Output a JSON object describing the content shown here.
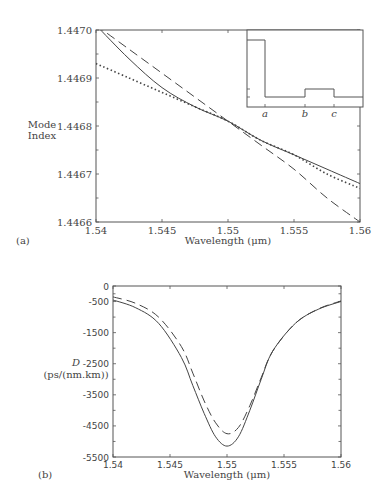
{
  "chart_data": [
    {
      "panel": "(a)",
      "type": "line",
      "title": "",
      "xlabel": "Wavelength (μm)",
      "ylabel": "Mode Index",
      "xlim": [
        1.54,
        1.56
      ],
      "ylim": [
        1.4466,
        1.447
      ],
      "xticks": [
        "1.54",
        "1.545",
        "1.55",
        "1.555",
        "1.56"
      ],
      "yticks": [
        "1.4466",
        "1.4467",
        "1.4468",
        "1.4469",
        "1.4470"
      ],
      "grid": false,
      "legend": null,
      "x": [
        1.54,
        1.5425,
        1.545,
        1.5475,
        1.55,
        1.5525,
        1.555,
        1.5575,
        1.56
      ],
      "series": [
        {
          "name": "solid",
          "style": "solid",
          "values": [
            1.44701,
            1.44694,
            1.44688,
            1.44684,
            1.44681,
            1.44677,
            1.44674,
            1.44671,
            1.44668
          ]
        },
        {
          "name": "dashed",
          "style": "dashed",
          "values": [
            1.44701,
            1.44696,
            1.44691,
            1.44686,
            1.44681,
            1.44676,
            1.44671,
            1.44665,
            1.4466
          ]
        },
        {
          "name": "dotted",
          "style": "dotted",
          "values": [
            1.44693,
            1.4469,
            1.44687,
            1.44684,
            1.44681,
            1.44677,
            1.44674,
            1.4467,
            1.44667
          ]
        }
      ],
      "inset": {
        "description": "refractive index profile (step)",
        "xtick_labels": [
          "a",
          "b",
          "c"
        ],
        "profile": [
          {
            "segment": "0-a",
            "level": "high"
          },
          {
            "segment": "a-b",
            "level": "low"
          },
          {
            "segment": "b-c",
            "level": "medium"
          },
          {
            "segment": "c-end",
            "level": "low"
          }
        ]
      }
    },
    {
      "panel": "(b)",
      "type": "line",
      "title": "",
      "xlabel": "Wavelength (μm)",
      "ylabel": "D (ps/(nm.km))",
      "xlim": [
        1.54,
        1.56
      ],
      "ylim": [
        -5500,
        0
      ],
      "xticks": [
        "1.54",
        "1.545",
        "1.55",
        "1.555",
        "1.56"
      ],
      "yticks": [
        "0",
        "-500",
        "-1500",
        "-2500",
        "-3500",
        "-4500",
        "-5500"
      ],
      "grid": false,
      "legend": null,
      "x": [
        1.54,
        1.542,
        1.544,
        1.546,
        1.547,
        1.548,
        1.549,
        1.55,
        1.551,
        1.552,
        1.553,
        1.554,
        1.556,
        1.558,
        1.56
      ],
      "series": [
        {
          "name": "solid",
          "style": "solid",
          "values": [
            -450,
            -700,
            -1200,
            -2300,
            -3200,
            -4100,
            -4850,
            -5150,
            -4850,
            -4000,
            -3000,
            -2100,
            -1200,
            -750,
            -500
          ]
        },
        {
          "name": "dashed",
          "style": "dashed",
          "values": [
            -350,
            -560,
            -1000,
            -1950,
            -2800,
            -3700,
            -4400,
            -4750,
            -4550,
            -3850,
            -2950,
            -2100,
            -1200,
            -740,
            -480
          ]
        }
      ]
    }
  ],
  "panel_a": {
    "label": "(a)",
    "ylabel_line1": "Mode",
    "ylabel_line2": "Index",
    "xlabel": "Wavelength (μm)",
    "xticks": [
      "1.54",
      "1.545",
      "1.55",
      "1.555",
      "1.56"
    ],
    "yticks": [
      "1.4466",
      "1.4467",
      "1.4468",
      "1.4469",
      "1.4470"
    ],
    "inset_labels": [
      "a",
      "b",
      "c"
    ]
  },
  "panel_b": {
    "label": "(b)",
    "ylabel_line1": "D",
    "ylabel_line2": "(ps/(nm.km))",
    "xlabel": "Wavelength (μm)",
    "xticks": [
      "1.54",
      "1.545",
      "1.55",
      "1.555",
      "1.56"
    ],
    "yticks": [
      "0",
      "-500",
      "-1500",
      "-2500",
      "-3500",
      "-4500",
      "-5500"
    ]
  }
}
